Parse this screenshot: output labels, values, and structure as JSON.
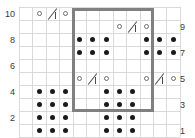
{
  "chart_data": {
    "type": "heatmap",
    "title": "",
    "subtitle": "",
    "xlabel": "",
    "ylabel": "",
    "grid": true,
    "legend_position": "none",
    "columns": 12,
    "rows": 10,
    "row_labels_left": [
      "10",
      "",
      "8",
      "",
      "6",
      "",
      "4",
      "",
      "2",
      ""
    ],
    "row_labels_right": [
      "",
      "9",
      "",
      "7",
      "",
      "5",
      "",
      "3",
      "",
      "1"
    ],
    "row_numbers_top_to_bottom": [
      10,
      9,
      8,
      7,
      6,
      5,
      4,
      3,
      2,
      1
    ],
    "symbol_legend": [
      {
        "key": "o",
        "name": "yarn-over-circle",
        "glyph": "o"
      },
      {
        "key": "dot",
        "name": "purl-dot",
        "glyph": "●"
      },
      {
        "key": "dec",
        "name": "decrease-slash",
        "glyph": "/|"
      },
      {
        "key": "",
        "name": "empty-knit-cell",
        "glyph": ""
      }
    ],
    "cells": [
      [
        "",
        "o",
        "dec",
        "o",
        "",
        "",
        "",
        "",
        "",
        "",
        "",
        ""
      ],
      [
        "",
        "",
        "",
        "",
        "",
        "",
        "",
        "o",
        "dec",
        "o",
        "",
        ""
      ],
      [
        "",
        "",
        "",
        "",
        "dot",
        "dot",
        "dot",
        "",
        "",
        "dot",
        "dot",
        "dot"
      ],
      [
        "",
        "",
        "",
        "",
        "dot",
        "dot",
        "dot",
        "",
        "",
        "dot",
        "dot",
        "dot"
      ],
      [
        "",
        "",
        "",
        "",
        "",
        "",
        "",
        "",
        "",
        "",
        "",
        ""
      ],
      [
        "",
        "",
        "",
        "",
        "o",
        "dec",
        "o",
        "",
        "",
        "o",
        "dec",
        "o"
      ],
      [
        "",
        "dot",
        "dot",
        "dot",
        "",
        "",
        "dot",
        "dot",
        "dot",
        "",
        "",
        ""
      ],
      [
        "",
        "dot",
        "dot",
        "dot",
        "",
        "",
        "dot",
        "dot",
        "dot",
        "",
        "",
        ""
      ],
      [
        "",
        "dot",
        "dot",
        "dot",
        "",
        "",
        "dot",
        "dot",
        "dot",
        "",
        "",
        ""
      ],
      [
        "",
        "dot",
        "dot",
        "dot",
        "",
        "",
        "dot",
        "dot",
        "dot",
        "",
        "",
        ""
      ]
    ],
    "repeat_box": {
      "label": "pattern-repeat",
      "start_col": 5,
      "end_col": 10,
      "start_row_top": 10,
      "end_row_bottom": 3,
      "color": "#808080"
    },
    "colors": {
      "gridline": "#d9d9d9",
      "symbol_dark": "#1a1a1a",
      "symbol_outline": "#6d6d6d",
      "repeat_border": "#808080",
      "axis_text": "#3a3a3a",
      "background": "#ffffff"
    }
  }
}
